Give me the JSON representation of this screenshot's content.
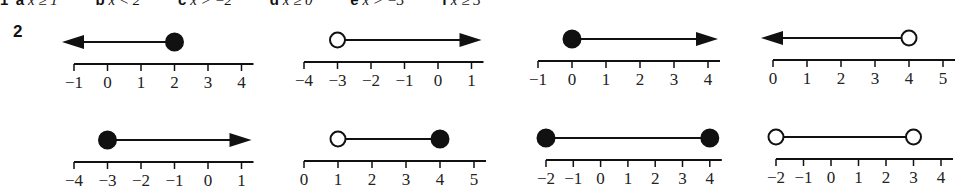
{
  "question1": {
    "number": "1",
    "parts": [
      {
        "label": "a",
        "text": "x ≥ 1"
      },
      {
        "label": "b",
        "text": "x < 2"
      },
      {
        "label": "c",
        "text": "x > −2"
      },
      {
        "label": "d",
        "text": "x ≥ 0"
      },
      {
        "label": "e",
        "text": "x > −3"
      },
      {
        "label": "f",
        "text": "x ≥ 3"
      }
    ]
  },
  "question2": {
    "number": "2",
    "number_lines": [
      {
        "id": "r1c1",
        "ticks": [
          "−1",
          "0",
          "1",
          "2",
          "3",
          "4"
        ],
        "start": 2,
        "start_closed": true,
        "direction": "left"
      },
      {
        "id": "r1c2",
        "ticks": [
          "−4",
          "−3",
          "−2",
          "−1",
          "0",
          "1"
        ],
        "start": -3,
        "start_closed": false,
        "direction": "right"
      },
      {
        "id": "r1c3",
        "ticks": [
          "−1",
          "0",
          "1",
          "2",
          "3",
          "4"
        ],
        "start": 0,
        "start_closed": true,
        "direction": "right"
      },
      {
        "id": "r1c4",
        "ticks": [
          "0",
          "1",
          "2",
          "3",
          "4",
          "5"
        ],
        "start": 4,
        "start_closed": false,
        "direction": "left"
      },
      {
        "id": "r2c1",
        "ticks": [
          "−4",
          "−3",
          "−2",
          "−1",
          "0",
          "1"
        ],
        "start": -3,
        "start_closed": true,
        "direction": "right"
      },
      {
        "id": "r2c2",
        "ticks": [
          "0",
          "1",
          "2",
          "3",
          "4",
          "5"
        ],
        "start": 1,
        "start_closed": false,
        "end": 4,
        "end_closed": true,
        "direction": "segment"
      },
      {
        "id": "r2c3",
        "ticks": [
          "−2",
          "−1",
          "0",
          "1",
          "2",
          "3",
          "4"
        ],
        "start": -2,
        "start_closed": true,
        "end": 4,
        "end_closed": true,
        "direction": "segment"
      },
      {
        "id": "r2c4",
        "ticks": [
          "−2",
          "−1",
          "0",
          "1",
          "2",
          "3",
          "4"
        ],
        "start": -2,
        "start_closed": false,
        "end": 3,
        "end_closed": false,
        "direction": "segment"
      }
    ]
  },
  "colors": {
    "ink": "#111111",
    "background": "#ffffff"
  }
}
